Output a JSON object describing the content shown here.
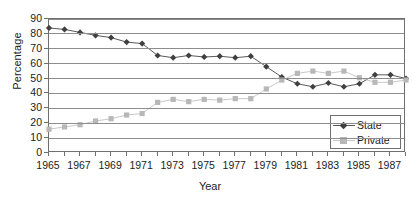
{
  "chart_data": {
    "type": "line",
    "title": "",
    "xlabel": "Year",
    "ylabel": "Percentage",
    "xlim": [
      1965,
      1988
    ],
    "ylim": [
      0,
      90
    ],
    "ytick_step": 10,
    "yticks": [
      90,
      80,
      70,
      60,
      50,
      40,
      30,
      20,
      10,
      0
    ],
    "x": [
      1965,
      1966,
      1967,
      1968,
      1969,
      1970,
      1971,
      1972,
      1973,
      1974,
      1975,
      1976,
      1977,
      1978,
      1979,
      1980,
      1981,
      1982,
      1983,
      1984,
      1985,
      1986,
      1987,
      1988
    ],
    "xticks_all": [
      1965,
      1966,
      1967,
      1968,
      1969,
      1970,
      1971,
      1972,
      1973,
      1974,
      1975,
      1976,
      1977,
      1978,
      1979,
      1980,
      1981,
      1982,
      1983,
      1984,
      1985,
      1986,
      1987,
      1988
    ],
    "xtick_labels": [
      "1965",
      "1967",
      "1969",
      "1971",
      "1973",
      "1975",
      "1977",
      "1979",
      "1981",
      "1983",
      "1985",
      "1987"
    ],
    "xtick_label_years": [
      1965,
      1967,
      1969,
      1971,
      1973,
      1975,
      1977,
      1979,
      1981,
      1983,
      1985,
      1987
    ],
    "grid": "horizontal",
    "legend_position": "bottom-right-inside",
    "series": [
      {
        "name": "State",
        "marker": "diamond",
        "color": "#404040",
        "line_color": "#5a5a5a",
        "values": [
          84,
          83,
          81,
          79,
          77.5,
          74.5,
          73.5,
          65.5,
          64,
          65.5,
          64.5,
          65,
          64,
          65,
          58,
          51,
          46.5,
          44.5,
          47,
          44.5,
          46.5,
          52.5,
          52.5,
          50
        ]
      },
      {
        "name": "Private",
        "marker": "square",
        "color": "#b8b8b8",
        "line_color": "#c9c9c9",
        "values": [
          16,
          17.5,
          19,
          21.5,
          23,
          25.5,
          26.5,
          34,
          36,
          34.5,
          36,
          35.5,
          36.5,
          36.5,
          43,
          49,
          53.5,
          55,
          53.5,
          55,
          50.5,
          47.5,
          47.5,
          49
        ]
      }
    ]
  },
  "legend": {
    "items": [
      {
        "label": "State"
      },
      {
        "label": "Private"
      }
    ]
  },
  "axes": {
    "y_title": "Percentage",
    "x_title": "Year"
  }
}
